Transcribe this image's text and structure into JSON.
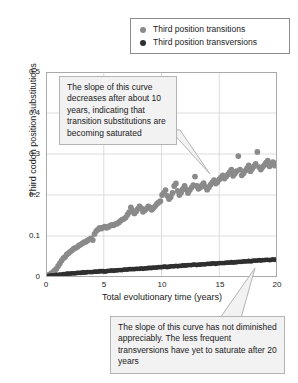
{
  "legend": {
    "position": "top-right",
    "items": [
      {
        "label": "Third position transitions",
        "color": "#8a8a8a",
        "marker": "circle-icon"
      },
      {
        "label": "Third position transversions",
        "color": "#2f2f2f",
        "marker": "circle-icon"
      }
    ]
  },
  "axes": {
    "xlabel": "Total evolutionary time (years)",
    "ylabel": "Third codon position substitutions",
    "xticks": [
      "0",
      "5",
      "10",
      "15",
      "20"
    ],
    "yticks": [
      "0",
      "0.1",
      "0.2",
      "0.3",
      "0.4",
      "0.5"
    ]
  },
  "callouts": {
    "transitions": "The slope of this curve decreases after about 10 years, indicating that transition substitutions are becoming saturated",
    "transversions": "The slope of this curve has not diminished appreciably. The less frequent transversions have yet to saturate after 20 years"
  },
  "chart_data": {
    "type": "scatter",
    "title": "",
    "xlabel": "Total evolutionary time (years)",
    "ylabel": "Third codon position substitutions",
    "xlim": [
      0,
      20
    ],
    "ylim": [
      0,
      0.5
    ],
    "xticks": [
      0,
      5,
      10,
      15,
      20
    ],
    "yticks": [
      0,
      0.1,
      0.2,
      0.3,
      0.4,
      0.5
    ],
    "grid": true,
    "legend_position": "top-right",
    "series": [
      {
        "name": "Third position transitions",
        "color": "#8a8a8a",
        "marker": "circle",
        "points": [
          [
            0.15,
            0.004
          ],
          [
            0.3,
            0.006
          ],
          [
            0.45,
            0.009
          ],
          [
            0.6,
            0.012
          ],
          [
            0.75,
            0.016
          ],
          [
            0.9,
            0.02
          ],
          [
            1.05,
            0.027
          ],
          [
            1.2,
            0.033
          ],
          [
            1.35,
            0.04
          ],
          [
            1.5,
            0.046
          ],
          [
            1.65,
            0.049
          ],
          [
            1.8,
            0.055
          ],
          [
            1.95,
            0.058
          ],
          [
            2.1,
            0.062
          ],
          [
            2.25,
            0.065
          ],
          [
            2.4,
            0.069
          ],
          [
            2.55,
            0.071
          ],
          [
            2.7,
            0.073
          ],
          [
            2.85,
            0.077
          ],
          [
            3.0,
            0.079
          ],
          [
            3.15,
            0.082
          ],
          [
            3.3,
            0.085
          ],
          [
            3.45,
            0.086
          ],
          [
            3.6,
            0.089
          ],
          [
            3.75,
            0.092
          ],
          [
            3.9,
            0.094
          ],
          [
            4.05,
            0.09
          ],
          [
            4.2,
            0.105
          ],
          [
            4.35,
            0.112
          ],
          [
            4.5,
            0.116
          ],
          [
            4.65,
            0.12
          ],
          [
            4.8,
            0.118
          ],
          [
            4.95,
            0.121
          ],
          [
            5.1,
            0.123
          ],
          [
            5.25,
            0.12
          ],
          [
            5.4,
            0.122
          ],
          [
            5.55,
            0.125
          ],
          [
            5.7,
            0.127
          ],
          [
            5.85,
            0.126
          ],
          [
            6.0,
            0.129
          ],
          [
            6.15,
            0.13
          ],
          [
            6.3,
            0.133
          ],
          [
            6.45,
            0.137
          ],
          [
            6.6,
            0.14
          ],
          [
            6.75,
            0.142
          ],
          [
            6.9,
            0.145
          ],
          [
            7.05,
            0.152
          ],
          [
            7.2,
            0.158
          ],
          [
            7.35,
            0.17
          ],
          [
            7.5,
            0.162
          ],
          [
            7.65,
            0.155
          ],
          [
            7.8,
            0.16
          ],
          [
            7.95,
            0.166
          ],
          [
            8.1,
            0.172
          ],
          [
            8.25,
            0.168
          ],
          [
            8.4,
            0.159
          ],
          [
            8.55,
            0.163
          ],
          [
            8.7,
            0.167
          ],
          [
            8.85,
            0.172
          ],
          [
            9.0,
            0.17
          ],
          [
            9.15,
            0.164
          ],
          [
            9.3,
            0.168
          ],
          [
            9.45,
            0.173
          ],
          [
            9.6,
            0.178
          ],
          [
            9.75,
            0.182
          ],
          [
            9.9,
            0.185
          ],
          [
            10.05,
            0.2
          ],
          [
            10.2,
            0.205
          ],
          [
            10.35,
            0.212
          ],
          [
            10.5,
            0.198
          ],
          [
            10.65,
            0.19
          ],
          [
            10.8,
            0.195
          ],
          [
            10.95,
            0.205
          ],
          [
            11.1,
            0.222
          ],
          [
            11.25,
            0.228
          ],
          [
            11.4,
            0.21
          ],
          [
            11.55,
            0.2
          ],
          [
            11.7,
            0.206
          ],
          [
            11.85,
            0.215
          ],
          [
            12.0,
            0.222
          ],
          [
            12.15,
            0.213
          ],
          [
            12.3,
            0.205
          ],
          [
            12.45,
            0.212
          ],
          [
            12.6,
            0.218
          ],
          [
            12.75,
            0.224
          ],
          [
            12.9,
            0.245
          ],
          [
            13.05,
            0.222
          ],
          [
            13.2,
            0.215
          ],
          [
            13.35,
            0.218
          ],
          [
            13.5,
            0.224
          ],
          [
            13.65,
            0.229
          ],
          [
            13.8,
            0.22
          ],
          [
            13.95,
            0.213
          ],
          [
            14.1,
            0.219
          ],
          [
            14.25,
            0.225
          ],
          [
            14.4,
            0.231
          ],
          [
            14.55,
            0.236
          ],
          [
            14.7,
            0.228
          ],
          [
            14.85,
            0.232
          ],
          [
            15.0,
            0.238
          ],
          [
            15.15,
            0.243
          ],
          [
            15.3,
            0.248
          ],
          [
            15.45,
            0.24
          ],
          [
            15.6,
            0.245
          ],
          [
            15.75,
            0.25
          ],
          [
            15.9,
            0.256
          ],
          [
            16.05,
            0.262
          ],
          [
            16.2,
            0.247
          ],
          [
            16.35,
            0.252
          ],
          [
            16.5,
            0.258
          ],
          [
            16.65,
            0.295
          ],
          [
            16.8,
            0.262
          ],
          [
            16.95,
            0.248
          ],
          [
            17.1,
            0.253
          ],
          [
            17.25,
            0.259
          ],
          [
            17.4,
            0.265
          ],
          [
            17.55,
            0.272
          ],
          [
            17.7,
            0.258
          ],
          [
            17.85,
            0.264
          ],
          [
            18.0,
            0.27
          ],
          [
            18.15,
            0.276
          ],
          [
            18.3,
            0.305
          ],
          [
            18.45,
            0.268
          ],
          [
            18.6,
            0.262
          ],
          [
            18.75,
            0.268
          ],
          [
            18.9,
            0.273
          ],
          [
            19.05,
            0.279
          ],
          [
            19.2,
            0.284
          ],
          [
            19.35,
            0.27
          ],
          [
            19.5,
            0.275
          ],
          [
            19.65,
            0.28
          ],
          [
            19.8,
            0.272
          ],
          [
            19.95,
            0.277
          ]
        ]
      },
      {
        "name": "Third position transversions",
        "color": "#2f2f2f",
        "marker": "circle",
        "points": [
          [
            0.15,
            0.002
          ],
          [
            0.3,
            0.003
          ],
          [
            0.45,
            0.003
          ],
          [
            0.6,
            0.004
          ],
          [
            0.75,
            0.004
          ],
          [
            0.9,
            0.005
          ],
          [
            1.05,
            0.005
          ],
          [
            1.2,
            0.006
          ],
          [
            1.35,
            0.006
          ],
          [
            1.5,
            0.007
          ],
          [
            1.65,
            0.007
          ],
          [
            1.8,
            0.008
          ],
          [
            1.95,
            0.008
          ],
          [
            2.1,
            0.008
          ],
          [
            2.25,
            0.009
          ],
          [
            2.4,
            0.009
          ],
          [
            2.55,
            0.009
          ],
          [
            2.7,
            0.01
          ],
          [
            2.85,
            0.01
          ],
          [
            3.0,
            0.01
          ],
          [
            3.15,
            0.011
          ],
          [
            3.3,
            0.011
          ],
          [
            3.45,
            0.011
          ],
          [
            3.6,
            0.012
          ],
          [
            3.75,
            0.012
          ],
          [
            3.9,
            0.012
          ],
          [
            4.05,
            0.012
          ],
          [
            4.2,
            0.013
          ],
          [
            4.35,
            0.013
          ],
          [
            4.5,
            0.013
          ],
          [
            4.65,
            0.014
          ],
          [
            4.8,
            0.014
          ],
          [
            4.95,
            0.014
          ],
          [
            5.1,
            0.013
          ],
          [
            5.25,
            0.014
          ],
          [
            5.4,
            0.015
          ],
          [
            5.55,
            0.015
          ],
          [
            5.7,
            0.016
          ],
          [
            5.85,
            0.015
          ],
          [
            6.0,
            0.016
          ],
          [
            6.15,
            0.016
          ],
          [
            6.3,
            0.017
          ],
          [
            6.45,
            0.017
          ],
          [
            6.6,
            0.017
          ],
          [
            6.75,
            0.018
          ],
          [
            6.9,
            0.018
          ],
          [
            7.05,
            0.018
          ],
          [
            7.2,
            0.019
          ],
          [
            7.35,
            0.019
          ],
          [
            7.5,
            0.019
          ],
          [
            7.65,
            0.019
          ],
          [
            7.8,
            0.02
          ],
          [
            7.95,
            0.02
          ],
          [
            8.1,
            0.02
          ],
          [
            8.25,
            0.021
          ],
          [
            8.4,
            0.02
          ],
          [
            8.55,
            0.021
          ],
          [
            8.7,
            0.021
          ],
          [
            8.85,
            0.022
          ],
          [
            9.0,
            0.022
          ],
          [
            9.15,
            0.022
          ],
          [
            9.3,
            0.023
          ],
          [
            9.45,
            0.023
          ],
          [
            9.6,
            0.023
          ],
          [
            9.75,
            0.024
          ],
          [
            9.9,
            0.024
          ],
          [
            10.05,
            0.024
          ],
          [
            10.2,
            0.025
          ],
          [
            10.35,
            0.025
          ],
          [
            10.5,
            0.024
          ],
          [
            10.65,
            0.025
          ],
          [
            10.8,
            0.026
          ],
          [
            10.95,
            0.026
          ],
          [
            11.1,
            0.026
          ],
          [
            11.25,
            0.027
          ],
          [
            11.4,
            0.026
          ],
          [
            11.55,
            0.027
          ],
          [
            11.7,
            0.027
          ],
          [
            11.85,
            0.028
          ],
          [
            12.0,
            0.028
          ],
          [
            12.15,
            0.028
          ],
          [
            12.3,
            0.029
          ],
          [
            12.45,
            0.029
          ],
          [
            12.6,
            0.029
          ],
          [
            12.75,
            0.03
          ],
          [
            12.9,
            0.03
          ],
          [
            13.05,
            0.029
          ],
          [
            13.2,
            0.03
          ],
          [
            13.35,
            0.03
          ],
          [
            13.5,
            0.031
          ],
          [
            13.65,
            0.031
          ],
          [
            13.8,
            0.031
          ],
          [
            13.95,
            0.032
          ],
          [
            14.1,
            0.032
          ],
          [
            14.25,
            0.032
          ],
          [
            14.4,
            0.033
          ],
          [
            14.55,
            0.033
          ],
          [
            14.7,
            0.032
          ],
          [
            14.85,
            0.033
          ],
          [
            15.0,
            0.034
          ],
          [
            15.15,
            0.034
          ],
          [
            15.3,
            0.034
          ],
          [
            15.45,
            0.034
          ],
          [
            15.6,
            0.035
          ],
          [
            15.75,
            0.035
          ],
          [
            15.9,
            0.035
          ],
          [
            16.05,
            0.036
          ],
          [
            16.2,
            0.035
          ],
          [
            16.35,
            0.036
          ],
          [
            16.5,
            0.036
          ],
          [
            16.65,
            0.037
          ],
          [
            16.8,
            0.037
          ],
          [
            16.95,
            0.037
          ],
          [
            17.1,
            0.038
          ],
          [
            17.25,
            0.038
          ],
          [
            17.4,
            0.038
          ],
          [
            17.55,
            0.039
          ],
          [
            17.7,
            0.038
          ],
          [
            17.85,
            0.039
          ],
          [
            18.0,
            0.04
          ],
          [
            18.15,
            0.04
          ],
          [
            18.3,
            0.04
          ],
          [
            18.45,
            0.041
          ],
          [
            18.6,
            0.04
          ],
          [
            18.75,
            0.041
          ],
          [
            18.9,
            0.041
          ],
          [
            19.05,
            0.042
          ],
          [
            19.2,
            0.042
          ],
          [
            19.35,
            0.041
          ],
          [
            19.5,
            0.042
          ],
          [
            19.65,
            0.043
          ],
          [
            19.8,
            0.042
          ],
          [
            19.95,
            0.043
          ]
        ]
      }
    ]
  }
}
